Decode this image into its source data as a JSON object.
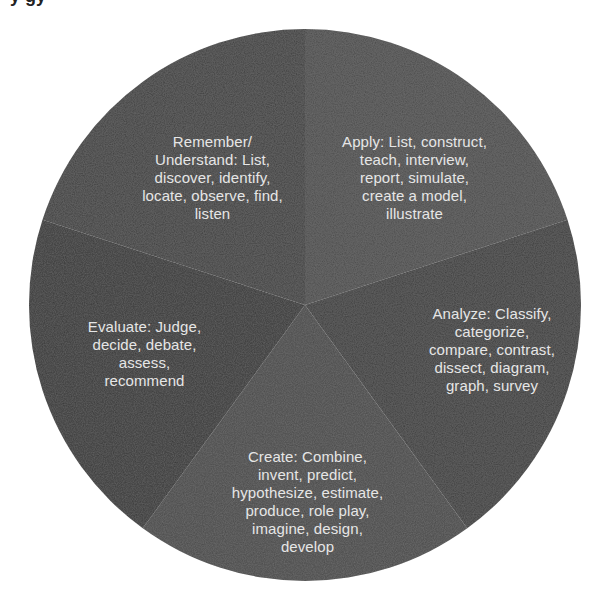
{
  "page": {
    "cropped_title_descenders": "y          gy"
  },
  "colors": {
    "background": "#ffffff",
    "label_text": "#e6e6e6",
    "remember": "#3e3e3e",
    "apply": "#4a4a4a",
    "analyze": "#3b3b3b",
    "create": "#474747",
    "evaluate": "#343434"
  },
  "chart_data": {
    "type": "pie",
    "title": "",
    "start_angle_deg": 0,
    "direction": "clockwise",
    "center": [
      305,
      305
    ],
    "radius": 276,
    "categories": [
      "Apply",
      "Analyze",
      "Create",
      "Evaluate",
      "Remember/Understand"
    ],
    "values": [
      20,
      20,
      20,
      20,
      20
    ],
    "slices": [
      {
        "name": "Apply",
        "value": 20,
        "color": "#4a4a4a",
        "label": "Apply: List, construct,\nteach, interview,\nreport, simulate,\ncreate a model,\nillustrate"
      },
      {
        "name": "Analyze",
        "value": 20,
        "color": "#3b3b3b",
        "label": "Analyze: Classify,\ncategorize,\ncompare, contrast,\ndissect, diagram,\ngraph, survey"
      },
      {
        "name": "Create",
        "value": 20,
        "color": "#474747",
        "label": "Create: Combine,\ninvent, predict,\nhypothesize, estimate,\nproduce, role play,\nimagine, design,\ndevelop"
      },
      {
        "name": "Evaluate",
        "value": 20,
        "color": "#343434",
        "label": "Evaluate: Judge,\ndecide, debate,\nassess,\nrecommend"
      },
      {
        "name": "Remember/Understand",
        "value": 20,
        "color": "#3e3e3e",
        "label": "Remember/\nUnderstand: List,\ndiscover, identify,\nlocate, observe, find,\nlisten"
      }
    ],
    "legend": "none",
    "grid": false
  }
}
